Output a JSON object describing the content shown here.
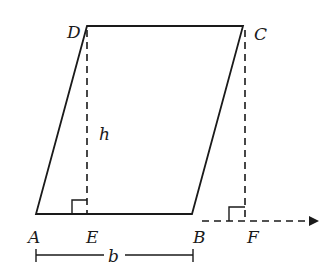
{
  "diagram": {
    "points": {
      "A": "A",
      "B": "B",
      "C": "C",
      "D": "D",
      "E": "E",
      "F": "F"
    },
    "height_label": "h",
    "base_label": "b",
    "colors": {
      "stroke": "#1a1a1a",
      "background": "#ffffff"
    }
  }
}
